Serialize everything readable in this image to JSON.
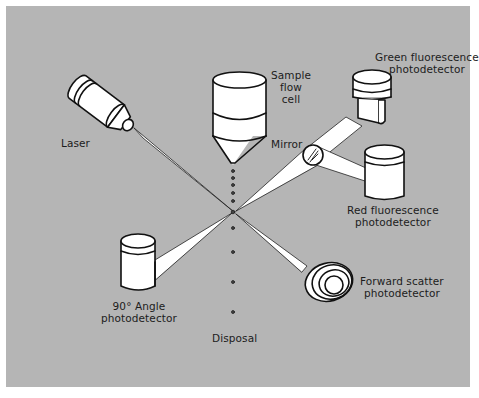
{
  "figure": {
    "background_color": "#b5b5b5",
    "line_color": "#111111",
    "fill_color": "#ffffff"
  },
  "labels": {
    "laser": "Laser",
    "sample_flow_cell": [
      "Sample",
      "flow",
      "cell"
    ],
    "mirror": "Mirror",
    "green_detector": [
      "Green fluorescence",
      "photodetector"
    ],
    "red_detector": [
      "Red fluorescence",
      "photodetector"
    ],
    "forward_scatter": [
      "Forward scatter",
      "photodetector"
    ],
    "side_scatter": [
      "90° Angle",
      "photodetector"
    ],
    "disposal": "Disposal"
  },
  "components": [
    {
      "id": "laser",
      "type": "light-source"
    },
    {
      "id": "sample_flow_cell",
      "type": "nozzle"
    },
    {
      "id": "mirror",
      "type": "dichroic-mirror"
    },
    {
      "id": "green_detector",
      "type": "photodetector"
    },
    {
      "id": "red_detector",
      "type": "photodetector"
    },
    {
      "id": "forward_scatter",
      "type": "photodetector"
    },
    {
      "id": "side_scatter",
      "type": "photodetector"
    },
    {
      "id": "disposal",
      "type": "waste"
    }
  ],
  "connections": [
    {
      "from": "laser",
      "to": "interrogation_point"
    },
    {
      "from": "sample_flow_cell",
      "to": "interrogation_point",
      "via": "droplet_stream"
    },
    {
      "from": "interrogation_point",
      "to": "mirror"
    },
    {
      "from": "mirror",
      "to": "green_detector"
    },
    {
      "from": "mirror",
      "to": "red_detector"
    },
    {
      "from": "interrogation_point",
      "to": "forward_scatter"
    },
    {
      "from": "interrogation_point",
      "to": "side_scatter"
    },
    {
      "from": "interrogation_point",
      "to": "disposal",
      "via": "droplet_stream"
    }
  ]
}
